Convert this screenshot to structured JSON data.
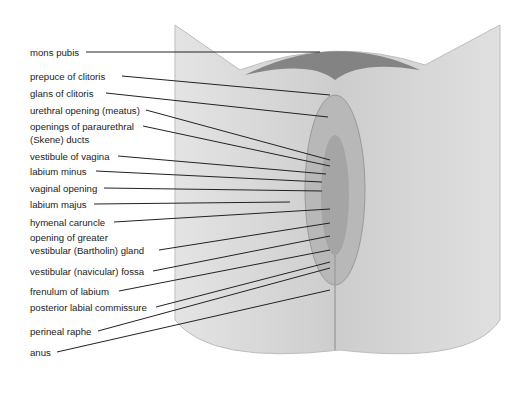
{
  "diagram": {
    "type": "anatomical-labeled-illustration",
    "colors": {
      "background": "#ffffff",
      "skin": "#cfcfcf",
      "skin_shadow": "#9a9a9a",
      "hair": "#5a5a5a",
      "leader_line": "#222222",
      "text": "#222222"
    }
  },
  "labels": [
    {
      "id": "mons-pubis",
      "text": "mons pubis",
      "y": 48
    },
    {
      "id": "prepuce-of-clitoris",
      "text": "prepuce of clitoris",
      "y": 72
    },
    {
      "id": "glans-of-clitoris",
      "text": "glans of clitoris",
      "y": 89
    },
    {
      "id": "urethral-opening",
      "text": "urethral opening (meatus)",
      "y": 106
    },
    {
      "id": "paraurethral-ducts-1",
      "text": "openings of paraurethral",
      "y": 122
    },
    {
      "id": "paraurethral-ducts-2",
      "text": "(Skene) ducts",
      "y": 135
    },
    {
      "id": "vestibule-of-vagina",
      "text": "vestibule of vagina",
      "y": 152
    },
    {
      "id": "labium-minus",
      "text": "labium minus",
      "y": 167
    },
    {
      "id": "vaginal-opening",
      "text": "vaginal opening",
      "y": 184
    },
    {
      "id": "labium-majus",
      "text": "labium majus",
      "y": 200
    },
    {
      "id": "hymenal-caruncle",
      "text": "hymenal caruncle",
      "y": 218
    },
    {
      "id": "bartholin-gland-1",
      "text": "opening of greater",
      "y": 233
    },
    {
      "id": "bartholin-gland-2",
      "text": "vestibular (Bartholin) gland",
      "y": 246
    },
    {
      "id": "navicular-fossa",
      "text": "vestibular (navicular) fossa",
      "y": 267
    },
    {
      "id": "frenulum-of-labium",
      "text": "frenulum of labium",
      "y": 287
    },
    {
      "id": "posterior-labial-commissure",
      "text": "posterior labial commissure",
      "y": 303
    },
    {
      "id": "perineal-raphe",
      "text": "perineal raphe",
      "y": 327
    },
    {
      "id": "anus",
      "text": "anus",
      "y": 348
    }
  ]
}
